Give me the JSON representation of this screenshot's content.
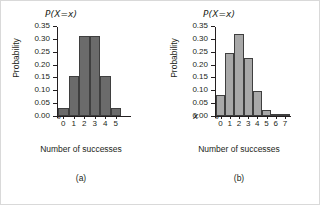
{
  "figure": {
    "background": "#ffffff",
    "border_color": "#d9d9d9"
  },
  "chart_data": [
    {
      "type": "bar",
      "panel": "a",
      "caption": "(a)",
      "title": "P(X=x)",
      "xlabel": "Number of successes",
      "ylabel": "Probability",
      "x_axis_variable": "x",
      "categories": [
        "0",
        "1",
        "2",
        "3",
        "4",
        "5"
      ],
      "values": [
        0.031,
        0.156,
        0.313,
        0.313,
        0.156,
        0.031
      ],
      "ytick_labels": [
        "0.00",
        "0.05",
        "0.10",
        "0.15",
        "0.20",
        "0.25",
        "0.30",
        "0.35"
      ],
      "ytick_values": [
        0.0,
        0.05,
        0.1,
        0.15,
        0.2,
        0.25,
        0.3,
        0.35
      ],
      "ylim": [
        0,
        0.35
      ],
      "grid": false,
      "legend": "none",
      "bar_color": "#6b6b6b",
      "bar_border_color": "#3f3f3f",
      "axis_break": "//"
    },
    {
      "type": "bar",
      "panel": "b",
      "caption": "(b)",
      "title": "P(X=x)",
      "xlabel": "Number of successes",
      "ylabel": "Probability",
      "x_axis_variable": "x",
      "categories": [
        "0",
        "1",
        "2",
        "3",
        "4",
        "5",
        "6",
        "7"
      ],
      "values": [
        0.082,
        0.247,
        0.318,
        0.227,
        0.097,
        0.025,
        0.004,
        0.0002
      ],
      "ytick_labels": [
        "0.00",
        "0.05",
        "0.10",
        "0.15",
        "0.20",
        "0.25",
        "0.30",
        "0.35"
      ],
      "ytick_values": [
        0.0,
        0.05,
        0.1,
        0.15,
        0.2,
        0.25,
        0.3,
        0.35
      ],
      "ylim": [
        0,
        0.35
      ],
      "grid": false,
      "legend": "none",
      "bar_color": "#a8a8a8",
      "bar_border_color": "#3f3f3f",
      "axis_break": "//"
    }
  ]
}
